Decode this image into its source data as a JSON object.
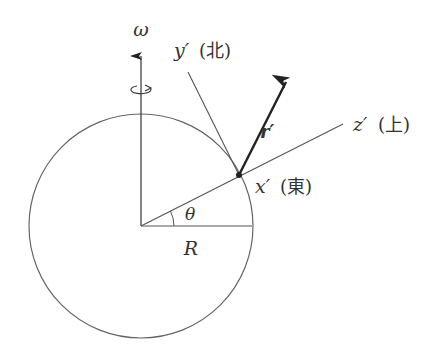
{
  "diagram": {
    "colors": {
      "stroke": "#555555",
      "vector": "#222222",
      "text": "#333333",
      "background": "#ffffff"
    },
    "labels": {
      "omega": "ω",
      "y_axis": "y′",
      "y_dir": "(北)",
      "z_axis": "z′",
      "z_dir": "(上)",
      "x_axis": "x′",
      "x_dir": "(東)",
      "vector": "r′",
      "angle": "θ",
      "radius": "R"
    },
    "elements": [
      {
        "name": "earth-circle",
        "type": "circle",
        "center": [
          141,
          226
        ],
        "radius": 112
      },
      {
        "name": "rotation-axis",
        "type": "arrow",
        "from": [
          141,
          226
        ],
        "to": [
          141,
          53
        ]
      },
      {
        "name": "radius-line",
        "type": "line",
        "from": [
          141,
          226
        ],
        "to": [
          252,
          226
        ]
      },
      {
        "name": "z-prime-line",
        "type": "line",
        "from": [
          141,
          226
        ],
        "to": [
          343,
          124
        ]
      },
      {
        "name": "y-prime-line",
        "type": "line",
        "from": [
          239,
          175
        ],
        "to": [
          188,
          72
        ]
      },
      {
        "name": "r-prime-vector",
        "type": "arrow",
        "from": [
          239,
          175
        ],
        "to": [
          289,
          75
        ]
      },
      {
        "name": "surface-point",
        "type": "dot",
        "at": [
          239,
          175
        ]
      },
      {
        "name": "theta-arc",
        "type": "arc",
        "radius": 33,
        "angle_deg": 27.5
      }
    ]
  }
}
